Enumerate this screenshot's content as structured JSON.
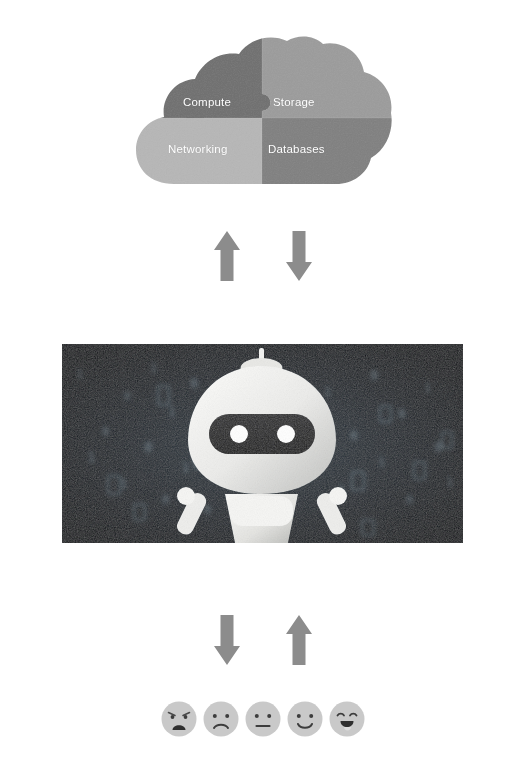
{
  "diagram": {
    "title": "Cloud services, AI robot agent and user feedback loop"
  },
  "cloud": {
    "name": "cloud-puzzle",
    "quadrants": [
      {
        "id": "compute",
        "label": "Compute",
        "color": "#6f6f6f",
        "position": "top-left"
      },
      {
        "id": "storage",
        "label": "Storage",
        "color": "#9a9a9a",
        "position": "top-right"
      },
      {
        "id": "networking",
        "label": "Networking",
        "color": "#b5b5b5",
        "position": "bottom-left"
      },
      {
        "id": "databases",
        "label": "Databases",
        "color": "#7e7e7e",
        "position": "bottom-right"
      }
    ],
    "label_color": "#ffffff"
  },
  "arrows_top": {
    "name": "cloud-robot-exchange",
    "color": "#8c8c8c",
    "items": [
      {
        "id": "arrow-up-to-cloud",
        "direction": "up",
        "label": "Up to cloud"
      },
      {
        "id": "arrow-down-to-robot",
        "direction": "down",
        "label": "Down to robot"
      }
    ]
  },
  "robot": {
    "name": "ai-robot-photo",
    "alt": "White humanoid robot with dark visor and two round eyes standing in front of dark blue binary code background",
    "background_color": "#141a1f",
    "body_color": "#f2f2f0",
    "visor_color": "#1d1d1d",
    "eye_color": "#ffffff",
    "code_glyphs": [
      "0",
      "1",
      "0",
      "1",
      "1",
      "0",
      "8",
      "0",
      "1",
      "0",
      "1",
      "0",
      "1",
      "1",
      "0",
      "1",
      "0",
      "0",
      "1",
      "0",
      "1",
      "0",
      "1",
      "0"
    ]
  },
  "arrows_bottom": {
    "name": "robot-user-exchange",
    "color": "#8c8c8c",
    "items": [
      {
        "id": "arrow-down-to-user",
        "direction": "down",
        "label": "Down to user"
      },
      {
        "id": "arrow-up-to-robot",
        "direction": "up",
        "label": "Up to robot"
      }
    ]
  },
  "feedback_scale": {
    "name": "satisfaction-face-scale",
    "face_color": "#c9c9c9",
    "feature_color": "#4a4a4a",
    "faces": [
      {
        "id": "face-angry",
        "mood": "angry",
        "label": "Angry"
      },
      {
        "id": "face-sad",
        "mood": "sad",
        "label": "Sad"
      },
      {
        "id": "face-neutral",
        "mood": "neutral",
        "label": "Neutral"
      },
      {
        "id": "face-happy",
        "mood": "happy",
        "label": "Happy"
      },
      {
        "id": "face-laughing",
        "mood": "excited",
        "label": "Very happy"
      }
    ]
  }
}
